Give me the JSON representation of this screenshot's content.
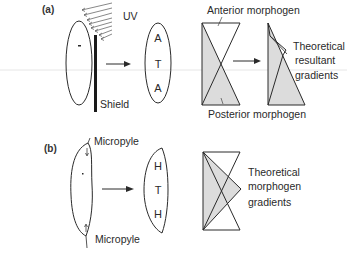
{
  "panel_a": {
    "label": "(a)",
    "uv_label": "UV",
    "shield_label": "Shield",
    "result_letters": [
      "A",
      "T",
      "A"
    ],
    "anterior_label": "Anterior morphogen",
    "posterior_label": "Posterior morphogen",
    "result_caption": [
      "Theoretical",
      "resultant",
      "gradients"
    ]
  },
  "panel_b": {
    "label": "(b)",
    "micropyle_top": "Micropyle",
    "micropyle_bottom": "Micropyle",
    "result_letters": [
      "H",
      "T",
      "H"
    ],
    "caption": [
      "Theoretical",
      "morphogen",
      "gradients"
    ]
  },
  "colors": {
    "line": "#2a2a2a",
    "gradient_fill": "#dcdcdc",
    "scan_line": "#e6e6e6"
  }
}
